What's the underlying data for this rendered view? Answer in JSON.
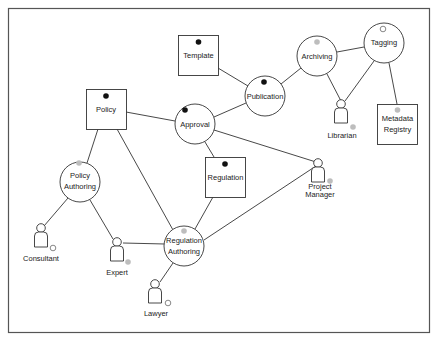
{
  "diagram": {
    "colors": {
      "line": "#333333",
      "border": "#555555",
      "black_dot": "#111111",
      "gray_dot": "#bdbdbd",
      "white_dot": "#ffffff"
    },
    "boxes": [
      {
        "id": "template",
        "label": [
          "Template"
        ],
        "x": 178,
        "y": 35,
        "w": 40,
        "h": 40,
        "dot": "black"
      },
      {
        "id": "policy",
        "label": [
          "Policy"
        ],
        "x": 86,
        "y": 89,
        "w": 40,
        "h": 40,
        "dot": "black"
      },
      {
        "id": "regulation",
        "label": [
          "Regulation"
        ],
        "x": 205,
        "y": 157,
        "w": 40,
        "h": 40,
        "dot": "black"
      },
      {
        "id": "metadata-registry",
        "label": [
          "Metadata",
          "Registry"
        ],
        "x": 377,
        "y": 104,
        "w": 41,
        "h": 40,
        "dot": "gray"
      }
    ],
    "circles": [
      {
        "id": "approval",
        "label": [
          "Approval"
        ],
        "cx": 195,
        "cy": 124,
        "r": 20,
        "dot": "black"
      },
      {
        "id": "publication",
        "label": [
          "Publication"
        ],
        "cx": 265,
        "cy": 96,
        "r": 20,
        "dot": "black"
      },
      {
        "id": "archiving",
        "label": [
          "Archiving"
        ],
        "cx": 317,
        "cy": 56,
        "r": 20,
        "dot": "gray"
      },
      {
        "id": "tagging",
        "label": [
          "Tagging"
        ],
        "cx": 384,
        "cy": 43,
        "r": 20,
        "dot": "white"
      },
      {
        "id": "policy-authoring",
        "label": [
          "Policy",
          "Authoring"
        ],
        "cx": 80,
        "cy": 182,
        "r": 20,
        "dot": "gray"
      },
      {
        "id": "regulation-authoring",
        "label": [
          "Regulation",
          "Authoring"
        ],
        "cx": 185,
        "cy": 247,
        "r": 20,
        "dot": "gray"
      }
    ],
    "actors": [
      {
        "id": "librarian",
        "label": [
          "Librarian"
        ],
        "x": 342,
        "y": 112,
        "dot": "gray"
      },
      {
        "id": "consultant",
        "label": [
          "Consultant"
        ],
        "x": 41,
        "y": 90,
        "dot": "white"
      },
      {
        "id": "expert",
        "label": [
          "Expert"
        ],
        "x": 117,
        "y": 102,
        "dot": "gray"
      },
      {
        "id": "lawyer",
        "label": [
          "Lawyer"
        ],
        "x": 155,
        "y": 144,
        "dot": "white"
      },
      {
        "id": "project-manager",
        "label": [
          "Project",
          "Manager"
        ],
        "x": 320,
        "y": 50,
        "dot": "gray"
      }
    ],
    "edges": [
      [
        "template",
        "publication"
      ],
      [
        "publication",
        "archiving"
      ],
      [
        "archiving",
        "tagging"
      ],
      [
        "archiving",
        "librarian"
      ],
      [
        "tagging",
        "librarian"
      ],
      [
        "tagging",
        "metadata-registry"
      ],
      [
        "policy",
        "approval"
      ],
      [
        "approval",
        "publication"
      ],
      [
        "approval",
        "regulation"
      ],
      [
        "approval",
        "project-manager"
      ],
      [
        "policy",
        "policy-authoring"
      ],
      [
        "policy",
        "regulation-authoring"
      ],
      [
        "policy-authoring",
        "consultant"
      ],
      [
        "policy-authoring",
        "expert"
      ],
      [
        "expert",
        "regulation-authoring"
      ],
      [
        "regulation",
        "regulation-authoring"
      ],
      [
        "project-manager",
        "regulation-authoring"
      ],
      [
        "regulation-authoring",
        "lawyer"
      ]
    ]
  },
  "labels": {
    "template": "Template",
    "policy": "Policy",
    "regulation": "Regulation",
    "metadata_1": "Metadata",
    "metadata_2": "Registry",
    "approval": "Approval",
    "publication": "Publication",
    "archiving": "Archiving",
    "tagging": "Tagging",
    "policy_authoring_1": "Policy",
    "policy_authoring_2": "Authoring",
    "regulation_authoring_1": "Regulation",
    "regulation_authoring_2": "Authoring",
    "librarian": "Librarian",
    "consultant": "Consultant",
    "expert": "Expert",
    "lawyer": "Lawyer",
    "project_manager_1": "Project",
    "project_manager_2": "Manager"
  }
}
